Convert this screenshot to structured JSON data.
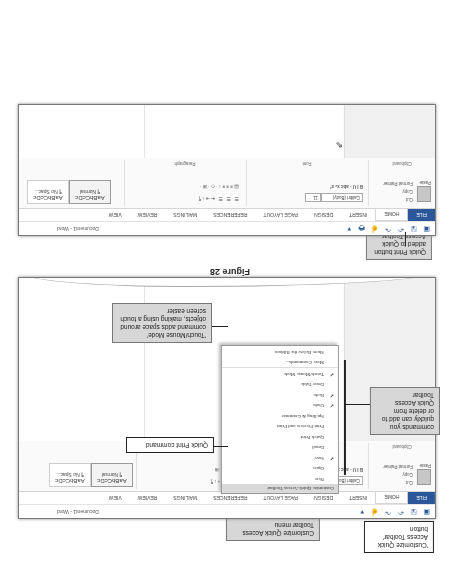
{
  "window": {
    "title": "Document1 - Word"
  },
  "quick_access_toolbar": {
    "icons": [
      "word-icon",
      "save-icon",
      "undo-icon",
      "redo-icon",
      "touch-mode-icon",
      "quick-print-icon",
      "customize-qat-icon"
    ]
  },
  "ribbon": {
    "tabs": [
      "FILE",
      "HOME",
      "INSERT",
      "DESIGN",
      "PAGE LAYOUT",
      "REFERENCES",
      "MAILINGS",
      "REVIEW",
      "VIEW"
    ],
    "clipboard": {
      "paste": "Paste",
      "cut": "Cut",
      "copy": "Copy",
      "format_painter": "Format Painter",
      "label": "Clipboard"
    },
    "font": {
      "name": "Calibri (Body)",
      "size": "11",
      "label": "Font"
    },
    "paragraph": {
      "label": "Paragraph"
    },
    "styles": [
      {
        "preview": "AaBbCcDc",
        "name": "¶ Normal"
      },
      {
        "preview": "AaBbCcDc",
        "name": "¶ No Spac..."
      }
    ]
  },
  "menu": {
    "header": "Customize Quick Access Toolbar",
    "items": [
      {
        "label": "New",
        "checked": false
      },
      {
        "label": "Open",
        "checked": false
      },
      {
        "label": "Save",
        "checked": true
      },
      {
        "label": "Email",
        "checked": false
      },
      {
        "label": "Quick Print",
        "checked": false
      },
      {
        "label": "Print Preview and Print",
        "checked": false
      },
      {
        "label": "Spelling & Grammar",
        "checked": false
      },
      {
        "label": "Undo",
        "checked": true
      },
      {
        "label": "Redo",
        "checked": true
      },
      {
        "label": "Draw Table",
        "checked": false
      },
      {
        "label": "Touch/Mouse Mode",
        "checked": true
      },
      {
        "label": "More Commands...",
        "checked": false
      },
      {
        "label": "Show Below the Ribbon",
        "checked": false
      }
    ]
  },
  "callouts": {
    "customize_button": "'Customize Quick Access Toolbar' button",
    "customize_menu": "Customize Quick Access Toolbar menu",
    "commands": "commands you quickly can add to or delete from Quick Access Toolbar",
    "quick_print_cmd": "Quick Print command",
    "touch_mode": "'Touch/Mouse Mode' command adds space around objects, making using a touch screen easier",
    "quick_print_added": "Quick Print button added to Quick Access Toolbar"
  },
  "captions": {
    "figure": "Figure 28"
  },
  "check_glyph": "✔"
}
